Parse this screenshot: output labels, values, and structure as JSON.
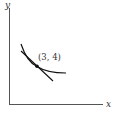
{
  "diagram": {
    "axes": {
      "x_label": "x",
      "y_label": "y"
    },
    "point": {
      "label": "(3, 4)",
      "x": 3,
      "y": 4
    },
    "elements": [
      {
        "type": "curve",
        "description": "decreasing convex curve (e.g. indifference / level curve)"
      },
      {
        "type": "tangent-line",
        "description": "tangent line touching the curve at (3, 4)"
      },
      {
        "type": "point",
        "label": "(3, 4)"
      }
    ],
    "colors": {
      "axis": "#555555",
      "curve": "#111111",
      "text": "#333333"
    }
  }
}
